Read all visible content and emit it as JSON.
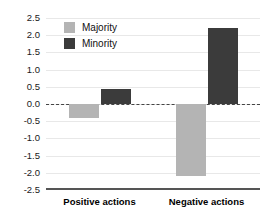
{
  "chart_data": {
    "type": "bar",
    "title": "",
    "subtitle": "",
    "xlabel": "",
    "ylabel": "",
    "categories": [
      "Positive actions",
      "Negative actions"
    ],
    "series": [
      {
        "name": "Majority",
        "color": "#b4b4b4",
        "values": [
          -0.42,
          -2.1
        ]
      },
      {
        "name": "Minority",
        "color": "#3b3b3b",
        "values": [
          0.45,
          2.2
        ]
      }
    ],
    "ylim": [
      -2.5,
      2.5
    ],
    "yticks": [
      2.5,
      2.0,
      1.5,
      1.0,
      0.5,
      0.0,
      -0.5,
      -1.0,
      -1.5,
      -2.0,
      -2.5
    ],
    "ytick_labels": [
      "2.5",
      "2.0",
      "1.5",
      "1.0",
      "0.5",
      "0.0",
      "-0.5",
      "-1.0",
      "-1.5",
      "-2.0",
      "-2.5"
    ],
    "grid": true,
    "zero_line": true,
    "zero_line_style": "dashed",
    "legend_position": "top-left",
    "legend_entries": [
      "Majority",
      "Minority"
    ],
    "annotations": []
  },
  "colors": {
    "majority": "#b4b4b4",
    "minority": "#3b3b3b",
    "grid": "#e8e8e8",
    "axis": "#555555",
    "zero": "#444444",
    "text": "#111111",
    "background": "#ffffff"
  }
}
